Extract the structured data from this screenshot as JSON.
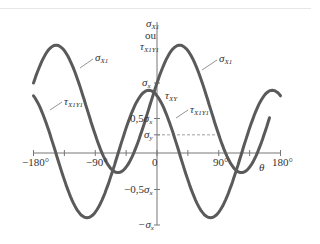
{
  "chart_data": {
    "type": "line",
    "title": "",
    "xlabel": "θ",
    "ylabel": "σx1 ou τx1y1",
    "xlim": [
      -180,
      180
    ],
    "ylim": [
      -1.0,
      1.6
    ],
    "y_unit": "σx",
    "x_ticks": [
      -180,
      -135,
      -90,
      -45,
      0,
      45,
      90,
      135,
      180
    ],
    "x_tick_labels": [
      "-180°",
      "-90°",
      "0",
      "90°",
      "180°"
    ],
    "y_tick_labels": [
      "σx",
      "0.5σx",
      "σy",
      "-0.5σx",
      "-σx"
    ],
    "parameters": {
      "sigma_x": 1.0,
      "sigma_y": 0.27,
      "tau_xy": 0.82
    },
    "series": [
      {
        "name": "σx1",
        "formula": "(σx+σy)/2 + (σx-σy)/2·cos2θ + τxy·sin2θ",
        "x": [
          -180,
          -150,
          -125,
          -90,
          -60,
          -35,
          0,
          30,
          55,
          90,
          120,
          145,
          180
        ],
        "values": [
          1.0,
          1.46,
          1.5,
          0.27,
          -0.6,
          -0.87,
          1.0,
          1.46,
          1.5,
          0.27,
          -0.6,
          -0.87,
          1.0
        ]
      },
      {
        "name": "τx1y1",
        "formula": "-(σx-σy)/2·sin2θ + τxy·cos2θ",
        "x": [
          -180,
          -150,
          -125,
          -90,
          -60,
          -35,
          0,
          30,
          55,
          90,
          120,
          145,
          180
        ],
        "values": [
          0.82,
          0.25,
          -0.22,
          -0.82,
          -0.09,
          0.62,
          0.82,
          0.25,
          -0.22,
          -0.82,
          -0.09,
          0.62,
          0.82
        ]
      }
    ],
    "reference_lines": [
      {
        "name": "σy",
        "value": 0.27,
        "style": "dashed",
        "from_x": 0,
        "to_x": 90
      }
    ],
    "annotations": [
      "σx1",
      "σx1",
      "τx1y1",
      "τx1y1",
      "τxy",
      "σx",
      "0.5σx",
      "σy"
    ],
    "grid": false,
    "legend": "none (inline annotations)"
  },
  "labels": {
    "y_axis_title_line1": "σ",
    "y_axis_title_sub1": "X1",
    "y_axis_title_line2": "ou",
    "y_axis_title_line3": "τ",
    "y_axis_title_sub3": "X1Y1",
    "x_axis_symbol": "θ",
    "x_minus180": "−180°",
    "x_minus90": "−90°",
    "x_zero": "0",
    "x_90": "90°",
    "x_180": "180°",
    "y_sigma_x": "σ",
    "y_sigma_x_sub": "x",
    "y_half_sigma_x_prefix": "0,5",
    "y_half_sigma_x": "σ",
    "y_half_sigma_x_sub": "x",
    "y_sigma_y": "σ",
    "y_sigma_y_sub": "y",
    "y_neg_half_prefix": "−0,5",
    "y_neg_half": "σ",
    "y_neg_half_sub": "x",
    "y_neg_sigma_x": "−σ",
    "y_neg_sigma_x_sub": "x",
    "ann_sigma": "σ",
    "ann_sigma_sub": "X1",
    "ann_tau": "τ",
    "ann_tau_sub": "X1Y1",
    "ann_tauxy": "τ",
    "ann_tauxy_sub": "XY"
  },
  "colors": {
    "curve": "#5a5a5a",
    "axis": "#777777",
    "dash": "#888888",
    "text": "#333333"
  }
}
